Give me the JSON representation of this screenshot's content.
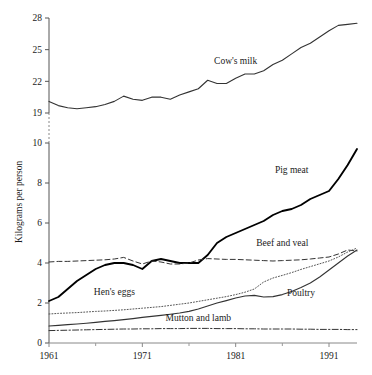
{
  "chart_data": {
    "type": "line",
    "title": "",
    "subtitle": "",
    "xlabel": "",
    "ylabel": "Kilograms per person",
    "xlim": [
      1961,
      1994
    ],
    "ylim_lower": [
      0,
      10
    ],
    "ylim_upper": [
      19,
      28
    ],
    "axis_break": true,
    "axis_break_note": "y-axis is broken between 10 and 19",
    "grid": false,
    "legend_position": "inline-labels",
    "x_ticks_major": [
      1961,
      1971,
      1981,
      1991
    ],
    "x_ticks_minor": [
      1966,
      1976,
      1986
    ],
    "x_tick_labels": [
      "1961",
      "1971",
      "1981",
      "1991"
    ],
    "y_ticks_lower": [
      0,
      2,
      4,
      6,
      8,
      10
    ],
    "y_ticks_upper": [
      19,
      22,
      25,
      28
    ],
    "y_tick_labels": [
      "0",
      "2",
      "4",
      "6",
      "8",
      "10",
      "19",
      "22",
      "25",
      "28"
    ],
    "x": [
      1961,
      1962,
      1963,
      1964,
      1965,
      1966,
      1967,
      1968,
      1969,
      1970,
      1971,
      1972,
      1973,
      1974,
      1975,
      1976,
      1977,
      1978,
      1979,
      1980,
      1981,
      1982,
      1983,
      1984,
      1985,
      1986,
      1987,
      1988,
      1989,
      1990,
      1991,
      1992,
      1993,
      1994
    ],
    "series": [
      {
        "name": "Cow's milk",
        "label": "Cow's milk",
        "line_style": "solid",
        "line_width": 1.1,
        "color": "#333333",
        "label_x": 1981,
        "label_y": 23.6,
        "values": [
          20.1,
          19.7,
          19.5,
          19.4,
          19.5,
          19.6,
          19.8,
          20.1,
          20.6,
          20.3,
          20.2,
          20.5,
          20.5,
          20.3,
          20.7,
          21.0,
          21.3,
          22.1,
          21.8,
          21.8,
          22.3,
          22.7,
          22.7,
          23.0,
          23.6,
          24.0,
          24.6,
          25.2,
          25.6,
          26.2,
          26.8,
          27.3,
          27.4,
          27.5
        ]
      },
      {
        "name": "Pig meat",
        "label": "Pig meat",
        "line_style": "solid",
        "line_width": 1.9,
        "color": "#000000",
        "label_x": 1987,
        "label_y": 8.5,
        "values": [
          2.1,
          2.3,
          2.7,
          3.1,
          3.4,
          3.7,
          3.9,
          4.0,
          4.0,
          3.9,
          3.7,
          4.1,
          4.2,
          4.1,
          4.0,
          4.0,
          4.0,
          4.4,
          5.0,
          5.3,
          5.5,
          5.7,
          5.9,
          6.1,
          6.4,
          6.6,
          6.7,
          6.9,
          7.2,
          7.4,
          7.6,
          8.2,
          8.9,
          9.7
        ]
      },
      {
        "name": "Beef and veal",
        "label": "Beef and veal",
        "line_style": "dashed",
        "line_width": 1.0,
        "color": "#333333",
        "label_x": 1986,
        "label_y": 4.85,
        "values": [
          4.05,
          4.08,
          4.08,
          4.1,
          4.12,
          4.14,
          4.16,
          4.2,
          4.28,
          4.1,
          3.95,
          4.1,
          4.05,
          3.95,
          3.95,
          4.0,
          4.15,
          4.22,
          4.2,
          4.18,
          4.18,
          4.16,
          4.14,
          4.12,
          4.1,
          4.12,
          4.14,
          4.16,
          4.2,
          4.25,
          4.3,
          4.45,
          4.65,
          4.6
        ]
      },
      {
        "name": "Hen's eggs",
        "label": "Hen's eggs",
        "line_style": "dotted",
        "line_width": 1.0,
        "color": "#555555",
        "label_x": 1968,
        "label_y": 2.4,
        "values": [
          1.45,
          1.48,
          1.5,
          1.52,
          1.55,
          1.58,
          1.6,
          1.63,
          1.66,
          1.7,
          1.74,
          1.78,
          1.82,
          1.88,
          1.94,
          2.0,
          2.08,
          2.16,
          2.24,
          2.32,
          2.42,
          2.54,
          2.7,
          3.05,
          3.25,
          3.38,
          3.52,
          3.68,
          3.82,
          3.96,
          4.1,
          4.3,
          4.55,
          4.75
        ]
      },
      {
        "name": "Poultry",
        "label": "Poultry",
        "line_style": "solid",
        "line_width": 1.1,
        "color": "#333333",
        "label_x": 1988,
        "label_y": 2.35,
        "values": [
          0.85,
          0.88,
          0.92,
          0.95,
          0.99,
          1.03,
          1.08,
          1.12,
          1.17,
          1.22,
          1.28,
          1.33,
          1.38,
          1.44,
          1.5,
          1.58,
          1.7,
          1.85,
          2.0,
          2.12,
          2.25,
          2.35,
          2.38,
          2.3,
          2.32,
          2.42,
          2.58,
          2.78,
          3.0,
          3.3,
          3.65,
          4.0,
          4.35,
          4.65
        ]
      },
      {
        "name": "Mutton and lamb",
        "label": "Mutton and lamb",
        "line_style": "dashdot",
        "line_width": 1.0,
        "color": "#333333",
        "label_x": 1977,
        "label_y": 1.1,
        "values": [
          0.62,
          0.63,
          0.64,
          0.65,
          0.66,
          0.67,
          0.68,
          0.69,
          0.7,
          0.7,
          0.71,
          0.71,
          0.72,
          0.72,
          0.72,
          0.73,
          0.73,
          0.73,
          0.72,
          0.72,
          0.72,
          0.71,
          0.71,
          0.7,
          0.7,
          0.7,
          0.7,
          0.69,
          0.69,
          0.68,
          0.68,
          0.68,
          0.67,
          0.67
        ]
      }
    ]
  },
  "axes": {
    "y_axis_title": "Kilograms per person"
  }
}
